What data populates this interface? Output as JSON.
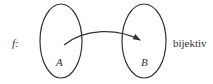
{
  "diagram": {
    "function_label": "f:",
    "set_a_label": "A",
    "set_b_label": "B",
    "property_label": "bijektiv",
    "stroke_color": "#333333"
  }
}
